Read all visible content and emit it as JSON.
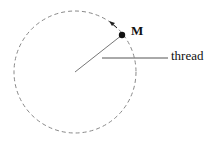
{
  "diagram": {
    "title": "",
    "nodes": [
      {
        "id": "M",
        "label": "M",
        "type": "point-mass"
      },
      {
        "id": "center",
        "label": "",
        "type": "pivot"
      }
    ],
    "labels": {
      "mass": "M",
      "thread": "thread"
    },
    "elements": {
      "circle": "dashed circular path",
      "arrow": "direction of motion (counterclockwise)",
      "thread_line": "line from center to M"
    }
  }
}
